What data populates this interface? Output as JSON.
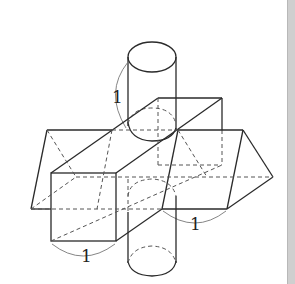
{
  "figure": {
    "shapes": [
      {
        "name": "cylinder",
        "dimension_label": "1"
      },
      {
        "name": "square-prism",
        "dimension_label": "1"
      },
      {
        "name": "triangular-prism",
        "dimension_label": "1"
      }
    ],
    "labels": {
      "cylinder_height": "1",
      "square_side": "1",
      "triangle_side": "1"
    }
  }
}
